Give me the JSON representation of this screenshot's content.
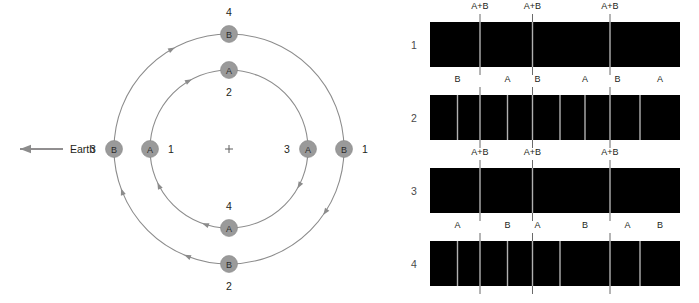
{
  "figure": {
    "orbit_diagram": {
      "center_marker": "+",
      "observer": {
        "label": "Earth",
        "direction": "left",
        "arrow_icon": "left-arrow-icon"
      },
      "orbits": [
        {
          "name": "outer-orbit",
          "star": "B",
          "radius": 115,
          "direction": "clockwise"
        },
        {
          "name": "inner-orbit",
          "star": "A",
          "radius": 79,
          "direction": "clockwise"
        }
      ],
      "stars": [
        {
          "id": "star-b-top",
          "letter": "B",
          "position_label": "4",
          "orbit": "outer",
          "angle_deg": 90,
          "label_side": "above"
        },
        {
          "id": "star-b-left",
          "letter": "B",
          "position_label": "3",
          "orbit": "outer",
          "angle_deg": 180,
          "label_side": "left"
        },
        {
          "id": "star-b-bottom",
          "letter": "B",
          "position_label": "2",
          "orbit": "outer",
          "angle_deg": 270,
          "label_side": "below"
        },
        {
          "id": "star-b-right",
          "letter": "B",
          "position_label": "1",
          "orbit": "outer",
          "angle_deg": 0,
          "label_side": "right"
        },
        {
          "id": "star-a-top",
          "letter": "A",
          "position_label": "2",
          "orbit": "inner",
          "angle_deg": 90,
          "label_side": "below"
        },
        {
          "id": "star-a-left",
          "letter": "A",
          "position_label": "1",
          "orbit": "inner",
          "angle_deg": 180,
          "label_side": "right"
        },
        {
          "id": "star-a-bottom",
          "letter": "A",
          "position_label": "4",
          "orbit": "inner",
          "angle_deg": 270,
          "label_side": "above"
        },
        {
          "id": "star-a-right",
          "letter": "A",
          "position_label": "3",
          "orbit": "inner",
          "angle_deg": 0,
          "label_side": "left"
        }
      ]
    },
    "band_diagram": {
      "rows": [
        {
          "number": "1",
          "labels": [
            "A+B",
            "A+B",
            "A+B"
          ],
          "label_positions_pct": [
            20,
            41,
            72
          ],
          "dividers": [
            {
              "pct": 20,
              "style": "gray",
              "tick": true
            },
            {
              "pct": 41,
              "style": "gray",
              "tick": true
            },
            {
              "pct": 72,
              "style": "gray",
              "tick": true
            }
          ]
        },
        {
          "number": "2",
          "labels": [
            "B",
            "A",
            "B",
            "A",
            "B",
            "A"
          ],
          "label_positions_pct": [
            11,
            31,
            43,
            62,
            75,
            92
          ],
          "dividers": [
            {
              "pct": 11,
              "style": "gray",
              "tick": false
            },
            {
              "pct": 20,
              "style": "gray",
              "tick": true
            },
            {
              "pct": 31,
              "style": "gray",
              "tick": false
            },
            {
              "pct": 41,
              "style": "gray",
              "tick": true
            },
            {
              "pct": 52,
              "style": "gray",
              "tick": false
            },
            {
              "pct": 62,
              "style": "gray",
              "tick": false
            },
            {
              "pct": 72,
              "style": "gray",
              "tick": true
            },
            {
              "pct": 84,
              "style": "gray",
              "tick": false
            }
          ]
        },
        {
          "number": "3",
          "labels": [
            "A+B",
            "A+B",
            "A+B"
          ],
          "label_positions_pct": [
            20,
            41,
            72
          ],
          "dividers": [
            {
              "pct": 20,
              "style": "gray",
              "tick": true
            },
            {
              "pct": 41,
              "style": "gray",
              "tick": true
            },
            {
              "pct": 72,
              "style": "gray",
              "tick": true
            }
          ]
        },
        {
          "number": "4",
          "labels": [
            "A",
            "B",
            "A",
            "B",
            "A",
            "B"
          ],
          "label_positions_pct": [
            11,
            31,
            43,
            62,
            79,
            92
          ],
          "dividers": [
            {
              "pct": 11,
              "style": "gray",
              "tick": false
            },
            {
              "pct": 20,
              "style": "gray",
              "tick": true
            },
            {
              "pct": 31,
              "style": "gray",
              "tick": false
            },
            {
              "pct": 41,
              "style": "gray",
              "tick": true
            },
            {
              "pct": 52,
              "style": "gray",
              "tick": false
            },
            {
              "pct": 72,
              "style": "gray",
              "tick": true
            },
            {
              "pct": 84,
              "style": "gray",
              "tick": false
            }
          ]
        }
      ]
    }
  },
  "colors": {
    "band_fill": "#000000",
    "divider_gray": "#b0b0b0",
    "orbit_stroke": "#8c8c8c",
    "star_fill": "#9a9a9a",
    "text": "#231f20"
  }
}
